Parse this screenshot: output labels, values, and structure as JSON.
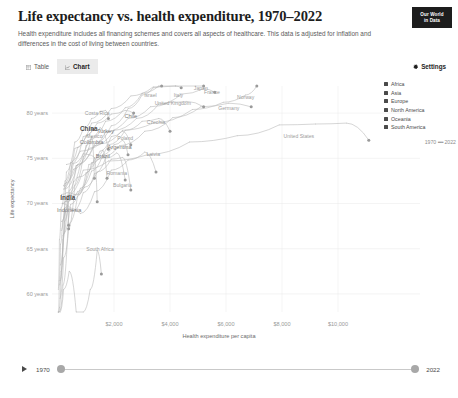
{
  "header": {
    "title": "Life expectancy vs. health expenditure, 1970–2022",
    "subtitle": "Health expenditure includes all financing schemes and covers all aspects of healthcare. This data is adjusted for inflation and differences in the cost of living between countries.",
    "logo_line1": "Our World",
    "logo_line2": "in Data"
  },
  "controls": {
    "tabs": [
      {
        "label": "Table",
        "icon": "table-icon",
        "active": false
      },
      {
        "label": "Chart",
        "icon": "chart-icon",
        "active": true
      }
    ],
    "settings_label": "Settings",
    "settings_icon": "gear-icon"
  },
  "legend": {
    "items": [
      {
        "label": "Africa",
        "color": "#4a4a4a"
      },
      {
        "label": "Asia",
        "color": "#4a4a4a"
      },
      {
        "label": "Europe",
        "color": "#4a4a4a"
      },
      {
        "label": "North America",
        "color": "#4a4a4a"
      },
      {
        "label": "Oceania",
        "color": "#4a4a4a"
      },
      {
        "label": "South America",
        "color": "#4a4a4a"
      }
    ],
    "time_start": "1970",
    "time_dashes": "••••",
    "time_end": "2022"
  },
  "timeline": {
    "play_icon": "play-icon",
    "start_year": "1970",
    "end_year": "2022"
  },
  "chart_data": {
    "type": "scatter",
    "title": "Life expectancy vs. health expenditure, 1970–2022",
    "subtitle": "Health expenditure includes all financing schemes and covers all aspects of healthcare. This data is adjusted for inflation and differences in the cost of living between countries.",
    "xlabel": "Health expenditure per capita",
    "ylabel": "Life expectancy",
    "xlim": [
      0,
      11500
    ],
    "ylim": [
      58,
      83
    ],
    "grid": true,
    "legend_position": "right",
    "xticks": [
      2000,
      4000,
      6000,
      8000,
      10000
    ],
    "xtick_labels": [
      "$2,000",
      "$4,000",
      "$6,000",
      "$8,000",
      "$10,000"
    ],
    "yticks": [
      60,
      65,
      70,
      75,
      80
    ],
    "ytick_labels": [
      "60 years",
      "65 years",
      "70 years",
      "75 years",
      "80 years"
    ],
    "annotations": [
      {
        "label": "Costa Rica",
        "x": 1400,
        "y": 79.8
      },
      {
        "label": "Israel",
        "x": 3300,
        "y": 81.8
      },
      {
        "label": "Japan",
        "x": 5100,
        "y": 82.6
      },
      {
        "label": "Italy",
        "x": 4300,
        "y": 81.8
      },
      {
        "label": "France",
        "x": 5500,
        "y": 82.1
      },
      {
        "label": "Norway",
        "x": 6700,
        "y": 81.6
      },
      {
        "label": "United Kingdom",
        "x": 4100,
        "y": 80.9
      },
      {
        "label": "Germany",
        "x": 6100,
        "y": 80.4
      },
      {
        "label": "Chile",
        "x": 2600,
        "y": 79.5
      },
      {
        "label": "Czechia",
        "x": 3500,
        "y": 78.8
      },
      {
        "label": "China",
        "x": 1100,
        "y": 78.0
      },
      {
        "label": "Turkey",
        "x": 1700,
        "y": 77.8
      },
      {
        "label": "Poland",
        "x": 2400,
        "y": 77.0
      },
      {
        "label": "Mexico",
        "x": 1300,
        "y": 77.2
      },
      {
        "label": "Colombia",
        "x": 1200,
        "y": 76.6
      },
      {
        "label": "Argentina",
        "x": 2200,
        "y": 76.0
      },
      {
        "label": "Latvia",
        "x": 3400,
        "y": 75.3
      },
      {
        "label": "Brazil",
        "x": 1600,
        "y": 75.0
      },
      {
        "label": "Romania",
        "x": 2100,
        "y": 73.2
      },
      {
        "label": "Bulgaria",
        "x": 2300,
        "y": 71.8
      },
      {
        "label": "India",
        "x": 350,
        "y": 70.4
      },
      {
        "label": "Indonesia",
        "x": 400,
        "y": 69.1
      },
      {
        "label": "South Africa",
        "x": 1500,
        "y": 64.8
      },
      {
        "label": "United States",
        "x": 8600,
        "y": 77.2
      }
    ],
    "series": [
      {
        "name": "United States",
        "region": "North America",
        "points": [
          [
            330,
            70.8
          ],
          [
            900,
            73.7
          ],
          [
            1800,
            74.7
          ],
          [
            3200,
            75.4
          ],
          [
            4700,
            76.8
          ],
          [
            6400,
            77.5
          ],
          [
            7900,
            78.7
          ],
          [
            9200,
            78.8
          ],
          [
            10300,
            78.9
          ],
          [
            11100,
            77.0
          ]
        ]
      },
      {
        "name": "Norway",
        "region": "Europe",
        "points": [
          [
            300,
            74.3
          ],
          [
            800,
            75.8
          ],
          [
            1500,
            76.6
          ],
          [
            2300,
            78.1
          ],
          [
            3400,
            78.9
          ],
          [
            4800,
            80.4
          ],
          [
            5900,
            81.2
          ],
          [
            6700,
            82.0
          ],
          [
            7100,
            83.2
          ]
        ]
      },
      {
        "name": "Germany",
        "region": "Europe",
        "points": [
          [
            280,
            70.8
          ],
          [
            700,
            72.9
          ],
          [
            1400,
            74.9
          ],
          [
            2200,
            76.4
          ],
          [
            3100,
            78.0
          ],
          [
            4100,
            79.5
          ],
          [
            5100,
            80.7
          ],
          [
            6100,
            81.1
          ],
          [
            6900,
            80.7
          ]
        ]
      },
      {
        "name": "France",
        "region": "Europe",
        "points": [
          [
            250,
            72.2
          ],
          [
            650,
            74.2
          ],
          [
            1300,
            76.4
          ],
          [
            2000,
            78.1
          ],
          [
            2800,
            79.4
          ],
          [
            3600,
            81.0
          ],
          [
            4400,
            82.1
          ],
          [
            5200,
            82.7
          ],
          [
            5600,
            82.3
          ]
        ]
      },
      {
        "name": "Japan",
        "region": "Asia",
        "points": [
          [
            200,
            72.0
          ],
          [
            600,
            76.1
          ],
          [
            1200,
            78.9
          ],
          [
            1900,
            80.5
          ],
          [
            2600,
            81.9
          ],
          [
            3400,
            82.9
          ],
          [
            4200,
            83.6
          ],
          [
            4900,
            84.5
          ],
          [
            5200,
            84.0
          ]
        ]
      },
      {
        "name": "United Kingdom",
        "region": "Europe",
        "points": [
          [
            220,
            71.9
          ],
          [
            550,
            73.8
          ],
          [
            1100,
            76.1
          ],
          [
            1700,
            77.9
          ],
          [
            2500,
            79.4
          ],
          [
            3300,
            80.7
          ],
          [
            4000,
            81.2
          ],
          [
            4600,
            81.3
          ],
          [
            5200,
            80.7
          ]
        ]
      },
      {
        "name": "Italy",
        "region": "Europe",
        "points": [
          [
            200,
            71.6
          ],
          [
            550,
            74.4
          ],
          [
            1100,
            77.0
          ],
          [
            1700,
            79.1
          ],
          [
            2400,
            80.6
          ],
          [
            3000,
            82.2
          ],
          [
            3600,
            83.0
          ],
          [
            4200,
            83.4
          ],
          [
            4400,
            82.8
          ]
        ]
      },
      {
        "name": "Israel",
        "region": "Asia",
        "points": [
          [
            250,
            71.6
          ],
          [
            700,
            74.3
          ],
          [
            1300,
            76.6
          ],
          [
            1900,
            78.6
          ],
          [
            2500,
            80.5
          ],
          [
            3000,
            82.0
          ],
          [
            3400,
            82.8
          ],
          [
            3700,
            83.0
          ]
        ]
      },
      {
        "name": "Czechia",
        "region": "Europe",
        "points": [
          [
            300,
            70.2
          ],
          [
            700,
            71.3
          ],
          [
            1200,
            74.5
          ],
          [
            1800,
            76.5
          ],
          [
            2400,
            78.1
          ],
          [
            3000,
            79.1
          ],
          [
            3600,
            79.4
          ],
          [
            4000,
            78.0
          ]
        ]
      },
      {
        "name": "Costa Rica",
        "region": "North America",
        "points": [
          [
            120,
            67.0
          ],
          [
            300,
            73.5
          ],
          [
            600,
            76.8
          ],
          [
            900,
            78.3
          ],
          [
            1200,
            79.4
          ],
          [
            1500,
            80.2
          ],
          [
            1700,
            80.3
          ],
          [
            1800,
            79.4
          ]
        ]
      },
      {
        "name": "Chile",
        "region": "South America",
        "points": [
          [
            100,
            63.2
          ],
          [
            250,
            70.2
          ],
          [
            500,
            74.4
          ],
          [
            900,
            77.4
          ],
          [
            1400,
            78.9
          ],
          [
            1900,
            79.9
          ],
          [
            2400,
            80.3
          ],
          [
            2700,
            80.0
          ]
        ]
      },
      {
        "name": "Poland",
        "region": "Europe",
        "points": [
          [
            150,
            70.0
          ],
          [
            400,
            70.9
          ],
          [
            750,
            71.0
          ],
          [
            1100,
            74.3
          ],
          [
            1500,
            75.8
          ],
          [
            1900,
            77.4
          ],
          [
            2300,
            78.0
          ],
          [
            2600,
            76.5
          ]
        ]
      },
      {
        "name": "Latvia",
        "region": "Europe",
        "points": [
          [
            180,
            70.0
          ],
          [
            450,
            69.5
          ],
          [
            800,
            68.9
          ],
          [
            1300,
            71.3
          ],
          [
            1900,
            73.7
          ],
          [
            2500,
            74.8
          ],
          [
            3100,
            75.7
          ],
          [
            3500,
            73.5
          ]
        ]
      },
      {
        "name": "Turkey",
        "region": "Asia",
        "points": [
          [
            60,
            54.0
          ],
          [
            180,
            61.0
          ],
          [
            350,
            67.0
          ],
          [
            600,
            72.0
          ],
          [
            900,
            75.2
          ],
          [
            1200,
            77.3
          ],
          [
            1500,
            78.4
          ],
          [
            1800,
            76.0
          ]
        ]
      },
      {
        "name": "China",
        "region": "Asia",
        "points": [
          [
            20,
            60.5
          ],
          [
            50,
            66.0
          ],
          [
            110,
            69.5
          ],
          [
            250,
            72.5
          ],
          [
            450,
            74.5
          ],
          [
            700,
            76.2
          ],
          [
            1000,
            77.5
          ],
          [
            1250,
            78.2
          ]
        ]
      },
      {
        "name": "Mexico",
        "region": "North America",
        "points": [
          [
            90,
            61.5
          ],
          [
            220,
            68.0
          ],
          [
            420,
            71.5
          ],
          [
            650,
            74.2
          ],
          [
            900,
            75.5
          ],
          [
            1100,
            75.4
          ],
          [
            1300,
            75.1
          ],
          [
            1400,
            70.2
          ]
        ]
      },
      {
        "name": "Colombia",
        "region": "South America",
        "points": [
          [
            70,
            61.0
          ],
          [
            180,
            66.5
          ],
          [
            350,
            70.1
          ],
          [
            550,
            72.4
          ],
          [
            800,
            74.4
          ],
          [
            1000,
            76.4
          ],
          [
            1200,
            77.4
          ],
          [
            1300,
            72.8
          ]
        ]
      },
      {
        "name": "Brazil",
        "region": "South America",
        "points": [
          [
            80,
            59.5
          ],
          [
            200,
            64.0
          ],
          [
            400,
            67.8
          ],
          [
            700,
            70.8
          ],
          [
            1000,
            73.4
          ],
          [
            1300,
            75.0
          ],
          [
            1600,
            75.9
          ],
          [
            1750,
            72.8
          ]
        ]
      },
      {
        "name": "Argentina",
        "region": "South America",
        "points": [
          [
            200,
            66.6
          ],
          [
            450,
            69.9
          ],
          [
            800,
            71.7
          ],
          [
            1200,
            73.6
          ],
          [
            1600,
            75.4
          ],
          [
            2000,
            76.5
          ],
          [
            2300,
            77.0
          ],
          [
            2500,
            75.4
          ]
        ]
      },
      {
        "name": "Romania",
        "region": "Europe",
        "points": [
          [
            120,
            68.0
          ],
          [
            300,
            69.5
          ],
          [
            550,
            69.2
          ],
          [
            900,
            71.2
          ],
          [
            1300,
            73.3
          ],
          [
            1700,
            75.0
          ],
          [
            2100,
            75.6
          ],
          [
            2400,
            72.6
          ]
        ]
      },
      {
        "name": "Bulgaria",
        "region": "Europe",
        "points": [
          [
            130,
            71.0
          ],
          [
            320,
            71.2
          ],
          [
            600,
            71.0
          ],
          [
            950,
            71.8
          ],
          [
            1400,
            73.5
          ],
          [
            1900,
            74.9
          ],
          [
            2300,
            75.1
          ],
          [
            2600,
            71.5
          ]
        ]
      },
      {
        "name": "India",
        "region": "Asia",
        "points": [
          [
            10,
            49.0
          ],
          [
            25,
            54.0
          ],
          [
            55,
            58.5
          ],
          [
            110,
            62.5
          ],
          [
            180,
            66.0
          ],
          [
            260,
            69.0
          ],
          [
            340,
            70.6
          ],
          [
            380,
            67.2
          ]
        ]
      },
      {
        "name": "Indonesia",
        "region": "Asia",
        "points": [
          [
            8,
            51.0
          ],
          [
            20,
            56.5
          ],
          [
            45,
            61.5
          ],
          [
            90,
            65.5
          ],
          [
            160,
            68.0
          ],
          [
            240,
            69.5
          ],
          [
            330,
            69.8
          ],
          [
            380,
            67.6
          ]
        ]
      },
      {
        "name": "South Africa",
        "region": "Africa",
        "points": [
          [
            80,
            55.5
          ],
          [
            200,
            60.5
          ],
          [
            400,
            62.5
          ],
          [
            650,
            57.5
          ],
          [
            900,
            54.5
          ],
          [
            1150,
            60.5
          ],
          [
            1400,
            64.8
          ],
          [
            1550,
            62.2
          ]
        ]
      }
    ]
  }
}
